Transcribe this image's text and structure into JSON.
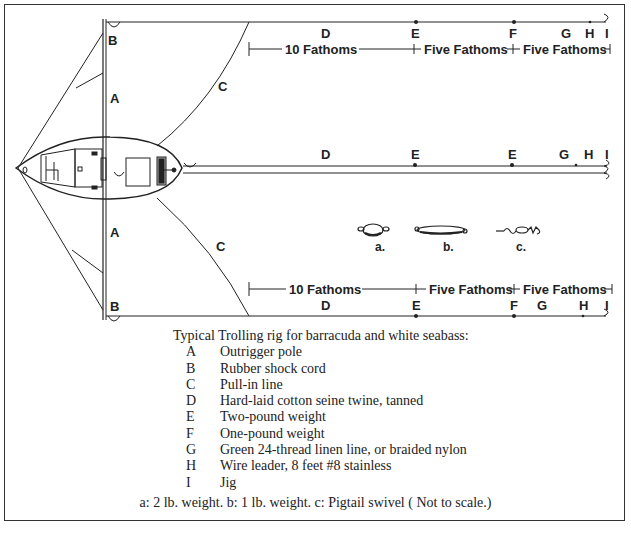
{
  "diagram": {
    "labels": {
      "outrigger_top": "A",
      "outrigger_bottom": "A",
      "shock_cord_top": "B",
      "shock_cord_bottom": "B",
      "pullin_top": "C",
      "pullin_bottom": "C"
    },
    "top_line": {
      "points": [
        "D",
        "E",
        "F",
        "G",
        "H",
        "I"
      ],
      "spans": [
        "10 Fathoms",
        "Five Fathoms",
        "Five Fathoms"
      ]
    },
    "middle_line": {
      "points": [
        "D",
        "E",
        "E",
        "G",
        "H",
        "I"
      ]
    },
    "bottom_line": {
      "points": [
        "D",
        "E",
        "F",
        "G",
        "H",
        "I"
      ],
      "spans": [
        "10 Fathoms",
        "Five Fathoms",
        "Five Fathoms"
      ]
    },
    "weights": [
      {
        "id": "a",
        "label": "a."
      },
      {
        "id": "b",
        "label": "b."
      },
      {
        "id": "c",
        "label": "c."
      }
    ]
  },
  "legend": {
    "title": "Typical Trolling rig for barracuda and white seabass:",
    "items": [
      {
        "key": "A",
        "text": "Outrigger pole"
      },
      {
        "key": "B",
        "text": "Rubber shock cord"
      },
      {
        "key": "C",
        "text": "Pull-in line"
      },
      {
        "key": "D",
        "text": "Hard-laid cotton seine twine, tanned"
      },
      {
        "key": "E",
        "text": "Two-pound weight"
      },
      {
        "key": "F",
        "text": "One-pound weight"
      },
      {
        "key": "G",
        "text": "Green 24-thread linen line, or braided nylon"
      },
      {
        "key": "H",
        "text": "Wire leader, 8 feet #8 stainless"
      },
      {
        "key": "I",
        "text": "Jig"
      }
    ]
  },
  "footnote": "a: 2 lb. weight.  b: 1 lb. weight.  c: Pigtail swivel ( Not to scale.)"
}
